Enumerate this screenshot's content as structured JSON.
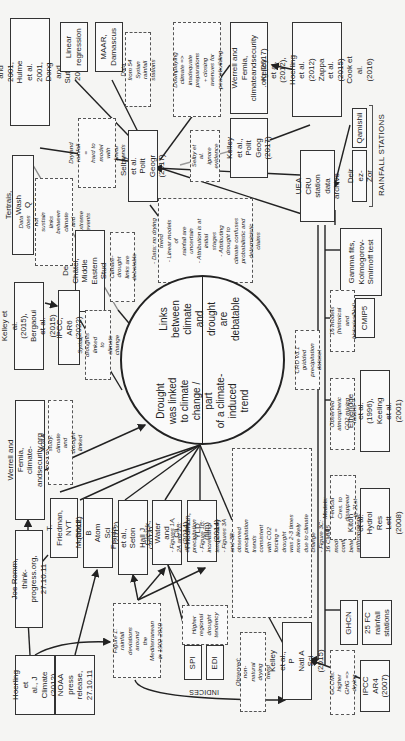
{
  "diagram": {
    "orientation": "rotated 90 degrees counterclockwise",
    "central_node": {
      "left_half": "Links between\nclimate and\ndrought\nare debatable",
      "right_half": "Drought\nwas linked\nto climate\nchange / part\nof a climate-\ninduced\ntrend"
    },
    "sources": {
      "hulme": "Hulme 1996 and 2001,\nHulme et al. 2001, Dong and\nSutton 2015",
      "linear_regression": "Linear\nregression",
      "maar": "MAAR,\nDamascus",
      "werrell_2017": "Werrell and Femia,\nclimateandsecurity\n.org (2017)",
      "kelley_2012": "Kelley et al. (2012),\nHoerling et al. (2012)\nZappa et al. (2015)\nCook et al. (2016)",
      "tertrais": "Tertrais, Wash Q (2011)",
      "selby": "Selby et al. Polit\nGeogr (2017)",
      "kelley_2017": "Kelley et al.,\nPolit Geog\n(2017)",
      "uea_cru": "UEA CRU station\ndata archive",
      "deir_ez_zor": "Deir ez-Zor",
      "qamishli": "Qamishli",
      "de_chatel": "De Châtel, Middle\nEastern Stud (2014)",
      "gamma": "Gamma fits,\nKolmogorov-\nSmirnoff test",
      "kelley_2015_bergaoui": "Kelley et al. (2015),\nBergaoui et al. (2015)",
      "ipcc_ar6": "IPCC, AR6 (2022)",
      "cmip5": "CMIP5",
      "werrell_2012": "Werrell and Femia, climate-\nandsecurity.org (2012)",
      "etheridge": "Etheridge et al. (1996),\nKeeling et al. (2001)",
      "joe_romm": "Joe Romm, think-\nprogress.org, 27.10.11",
      "friedman_nyt": "T. Friedman,\nNYT (2012)",
      "mohtadi": "Mohtadi, B\nAtom Sci (2012)",
      "femia_seton": "Femia et al., Seton\nHall J (2014)",
      "gleick": "Gleick, Water\nand Cli (2014)",
      "friedman_yld": "Friedman, YLD\n(film) (2014)",
      "kitoh": "Kitoh et al. Hydrol\nRes Lett (2008)",
      "hoerling_2012": "Hoerling et\nal., J Climate\n(2012)",
      "noaa_press": "NOAA press\nrelease,\n27.10.11",
      "spi": "SPI",
      "edi": "EDI",
      "ghcn": "GHCN",
      "fc_stations": "25 FC rainfall\nstations",
      "kelley_pnas": "Kelley et al., P\nNatl A Sci (2015)",
      "ipcc_ar4": "IPCC AR4\n(2007)"
    },
    "annotations": {
      "data_54_syrian": "Data from 54 Syrian\nrainfall stations",
      "downplaying": "Downplaying climate =>\ninadequate preparations\n+ closing avenues for\npeacebuilding",
      "dryland": "Dryland rainfall =\nhard to model\nwith linear trends",
      "selby_ignore": "Selby et al.\nignore\nevidence",
      "data_not_sustain": "Data does not sustain\nlinks between climate\nand extreme events",
      "data_no_drying": "- Data: no drying trend\n- Linear models of\nrainfall are uncertain\n- Attribution is at initial\nstages\n- Attributing drought to\nclimate confuses\nprobabilistic and\ndeterministic claims",
      "climate_drought_debatable": "Climate-drought\nlinks are debatable",
      "syrian_droughts": "Syrian droughts linked\nto climate change",
      "cru_gridded": "CRU v3.1 gridded\nprecipitation dataset",
      "sixteen_models": "16 models (historical\nand historicalNat)",
      "noaa_study": "NOAA study: climate\nand drought linked",
      "observed_co2": "Observed atmospheric\nCO2 mixing rations",
      "figures": "- Figures 1A, 2A and 2B: decreasing precipitation\n- Figure 1B: increasing temperature\n- Figures 3A and 3B: observed precipitation\ntrends consistent with CO2 forcing = drought\nwas 2-3 times more likely due to climate change\n- Figure 3C: 16 CMIP5 models confirm match\nbetween anthropogenic forcing and drought",
      "fertile_crescent": "Models: Fertical Cres. to\ndisappear in 21st century",
      "figure1_rainfall": "Figure 1: rainfall\ndeviations around\nthe Mediterranean\nin 1902-2010",
      "higher_regional": "Higher\nregional\ndrought\ntendency",
      "observed_non_natural": "Observed: non-\nnatural drying trend",
      "gccms": "GCCMs: higher\nGHG => drying"
    },
    "group_labels": {
      "rainfall_stations": "RAINFALL STATIONS",
      "indices": "INDICES"
    }
  }
}
